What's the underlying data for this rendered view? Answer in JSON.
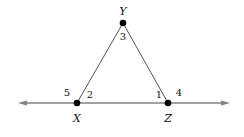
{
  "figure": {
    "type": "geometry-diagram",
    "canvas": {
      "width": 244,
      "height": 137,
      "background": "#ffffff"
    },
    "colors": {
      "line": "#808080",
      "triangle_side": "#555555",
      "point": "#000000",
      "text": "#111111"
    },
    "points": [
      {
        "id": "X",
        "label": "X",
        "x": 77,
        "y": 103,
        "label_x": 77,
        "label_y": 118,
        "icon": "vertex-dot"
      },
      {
        "id": "Z",
        "label": "Z",
        "x": 168,
        "y": 103,
        "label_x": 168,
        "label_y": 118,
        "icon": "vertex-dot"
      },
      {
        "id": "Y",
        "label": "Y",
        "x": 123,
        "y": 23,
        "label_x": 123,
        "label_y": 11,
        "icon": "vertex-dot"
      }
    ],
    "segments": [
      {
        "id": "XY",
        "from": "X",
        "to": "Y"
      },
      {
        "id": "ZY",
        "from": "Z",
        "to": "Y"
      }
    ],
    "ray_line": {
      "id": "XZ-line",
      "x1": 18,
      "y1": 103,
      "x2": 230,
      "y2": 103,
      "arrow_left": true,
      "arrow_right": true
    },
    "angle_labels": [
      {
        "id": "angle-5",
        "label": "5",
        "x": 67,
        "y": 93,
        "at_vertex": "X"
      },
      {
        "id": "angle-2",
        "label": "2",
        "x": 90,
        "y": 95,
        "at_vertex": "X"
      },
      {
        "id": "angle-3",
        "label": "3",
        "x": 123,
        "y": 37,
        "at_vertex": "Y"
      },
      {
        "id": "angle-1",
        "label": "1",
        "x": 159,
        "y": 95,
        "at_vertex": "Z"
      },
      {
        "id": "angle-4",
        "label": "4",
        "x": 179,
        "y": 93,
        "at_vertex": "Z"
      }
    ]
  }
}
